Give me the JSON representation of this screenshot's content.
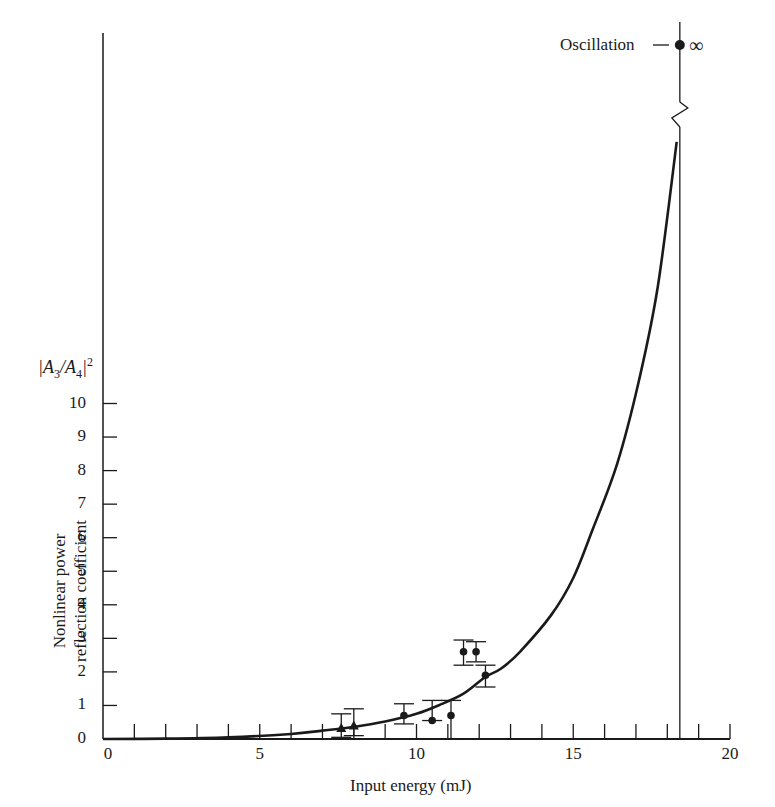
{
  "chart_data": {
    "type": "line",
    "title": "",
    "xlabel": "Input energy (mJ)",
    "ylabel": "Nonlinear power reflection coefficient",
    "ylabel_lines": [
      "Nonlinear power",
      "reflection coefficient"
    ],
    "y_quantity": "|A3/A4|^2",
    "xlim": [
      0,
      20
    ],
    "ylim": [
      0,
      10
    ],
    "x_ticks": [
      0,
      5,
      10,
      15,
      20
    ],
    "x_minor_step": 1,
    "y_ticks": [
      0,
      1,
      2,
      3,
      4,
      5,
      6,
      7,
      8,
      9,
      10
    ],
    "grid": false,
    "legend": null,
    "series": [
      {
        "name": "theory curve",
        "kind": "line",
        "x": [
          0,
          2,
          4,
          6,
          7,
          8,
          9,
          10,
          10.7,
          11.5,
          12.2,
          12.7,
          13.3,
          14.3,
          15.0,
          15.6,
          16.4,
          17.1,
          17.7,
          18.3
        ],
        "y": [
          0,
          0.01,
          0.05,
          0.15,
          0.25,
          0.36,
          0.52,
          0.75,
          1.0,
          1.35,
          1.85,
          2.1,
          2.6,
          3.7,
          4.8,
          6.2,
          8.2,
          10.7,
          13.5,
          17.8
        ]
      },
      {
        "name": "measured (triangles)",
        "kind": "scatter",
        "marker": "triangle",
        "x": [
          7.6,
          8.0
        ],
        "y": [
          0.33,
          0.4
        ],
        "err_low": [
          0.05,
          0.1
        ],
        "err_high": [
          0.75,
          0.9
        ]
      },
      {
        "name": "measured (circles)",
        "kind": "scatter",
        "marker": "circle",
        "x": [
          9.6,
          10.5,
          11.1,
          11.5,
          11.9,
          12.2
        ],
        "y": [
          0.7,
          0.55,
          0.7,
          2.6,
          2.6,
          1.9
        ],
        "err_low": [
          0.45,
          0.55,
          0.0,
          2.2,
          2.3,
          1.55
        ],
        "err_high": [
          1.05,
          1.15,
          1.15,
          2.95,
          2.9,
          2.2
        ]
      }
    ],
    "annotations": [
      {
        "text": "Oscillation",
        "symbol": "∞",
        "x": 18.4,
        "note": "point at infinity above axis break"
      }
    ],
    "threshold_line_x": 18.4
  },
  "labels": {
    "x_axis_title": "Input energy (mJ)",
    "y_axis_title_line1": "Nonlinear power",
    "y_axis_title_line2": "reflection coefficient",
    "y_unit_A3": "A",
    "y_unit_sub3": "3",
    "y_unit_A4": "A",
    "y_unit_sub4": "4",
    "y_unit_sup": "2",
    "oscillation": "Oscillation",
    "infinity": "∞",
    "x_tick_labels": [
      "0",
      "5",
      "10",
      "15",
      "20"
    ],
    "y_tick_labels": [
      "0",
      "1",
      "2",
      "3",
      "4",
      "5",
      "6",
      "7",
      "8",
      "9",
      "10"
    ]
  }
}
